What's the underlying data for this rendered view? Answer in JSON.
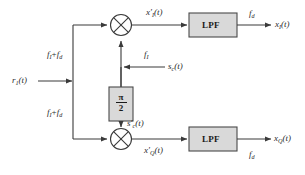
{
  "diagram": {
    "colors": {
      "line": "#3a3a3a",
      "box_fill": "#d9d9d9",
      "box_stroke": "#4a4a4a",
      "text": "#2b2b2b",
      "background": "#ffffff"
    },
    "input": {
      "label_main": "r",
      "label_sub": "1",
      "label_tail": "(t)"
    },
    "branch_labels": {
      "top": {
        "a": "f",
        "a_sub": "I",
        "plus": "+",
        "b": "f",
        "b_sub": "d"
      },
      "bottom": {
        "a": "f",
        "a_sub": "I",
        "plus": "+",
        "b": "f",
        "b_sub": "d"
      }
    },
    "mixers": [
      {
        "name": "mixer-i",
        "symbol": "multiply"
      },
      {
        "name": "mixer-q",
        "symbol": "multiply"
      }
    ],
    "mixer_outputs": {
      "top": {
        "base": "x",
        "prime": "′",
        "sub": "I",
        "tail": "(t)"
      },
      "bottom": {
        "base": "x",
        "prime": "′",
        "sub": "Q",
        "tail": "(t)"
      }
    },
    "carrier": {
      "source_label": {
        "base": "s",
        "sub": "c",
        "tail": "(t)"
      },
      "freq_label": {
        "base": "f",
        "sub": "I"
      },
      "shifted_label": {
        "base": "s",
        "prime": "′",
        "sub": "c",
        "tail": "(t)"
      }
    },
    "phase_shifter": {
      "numerator": "π",
      "denominator": "2"
    },
    "filters": [
      {
        "name": "lpf-i",
        "label": "LPF"
      },
      {
        "name": "lpf-q",
        "label": "LPF"
      }
    ],
    "filter_freq_labels": {
      "top": {
        "base": "f",
        "sub": "d"
      },
      "bottom": {
        "base": "f",
        "sub": "d"
      }
    },
    "outputs": {
      "top": {
        "base": "x",
        "sub": "I",
        "tail": "(t)"
      },
      "bottom": {
        "base": "x",
        "sub": "Q",
        "tail": "(t)"
      }
    }
  }
}
